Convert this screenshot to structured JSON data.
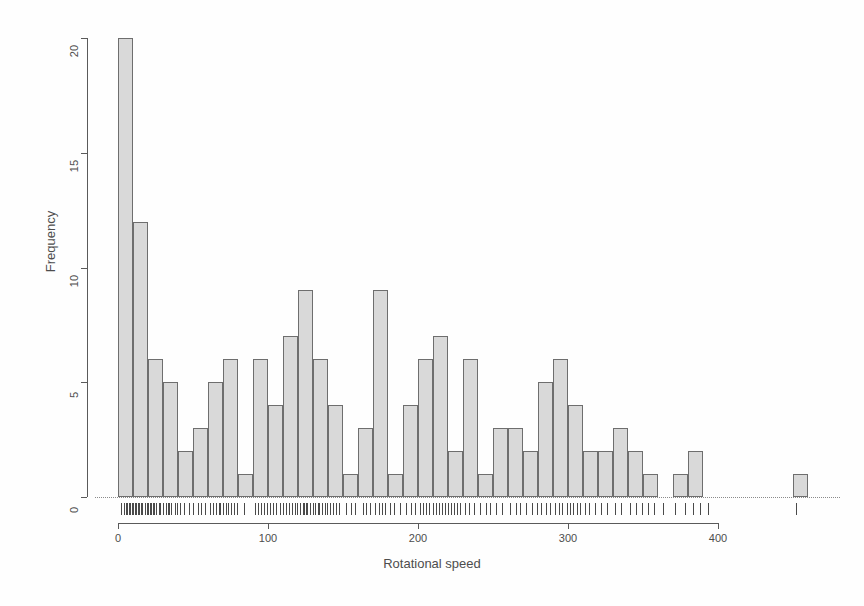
{
  "chart_data": {
    "type": "bar",
    "subtype": "histogram",
    "title": "",
    "xlabel": "Rotational speed",
    "ylabel": "Frequency",
    "xlim": [
      0,
      460
    ],
    "ylim": [
      0,
      20
    ],
    "bin_width": 10,
    "grid": false,
    "legend": null,
    "x_ticks": [
      0,
      100,
      200,
      300,
      400
    ],
    "x_tick_labels": [
      "0",
      "100",
      "200",
      "300",
      "400"
    ],
    "y_ticks": [
      0,
      5,
      10,
      15,
      20
    ],
    "y_tick_labels": [
      "0",
      "5",
      "10",
      "15",
      "20"
    ],
    "bin_starts": [
      0,
      10,
      20,
      30,
      40,
      50,
      60,
      70,
      80,
      90,
      100,
      110,
      120,
      130,
      140,
      150,
      160,
      170,
      180,
      190,
      200,
      210,
      220,
      230,
      240,
      250,
      260,
      270,
      280,
      290,
      300,
      310,
      320,
      330,
      340,
      350,
      360,
      370,
      380,
      390,
      400,
      410,
      420,
      430,
      440,
      450
    ],
    "values": [
      20,
      12,
      6,
      5,
      2,
      3,
      5,
      6,
      1,
      6,
      4,
      7,
      9,
      6,
      4,
      1,
      3,
      9,
      1,
      4,
      6,
      7,
      2,
      6,
      1,
      3,
      3,
      2,
      5,
      6,
      4,
      2,
      2,
      3,
      2,
      1,
      0,
      1,
      2,
      0,
      0,
      0,
      0,
      0,
      0,
      1
    ],
    "categories": [
      "0-10",
      "10-20",
      "20-30",
      "30-40",
      "40-50",
      "50-60",
      "60-70",
      "70-80",
      "80-90",
      "90-100",
      "100-110",
      "110-120",
      "120-130",
      "130-140",
      "140-150",
      "150-160",
      "160-170",
      "170-180",
      "180-190",
      "190-200",
      "200-210",
      "210-220",
      "220-230",
      "230-240",
      "240-250",
      "250-260",
      "260-270",
      "270-280",
      "280-290",
      "290-300",
      "300-310",
      "310-320",
      "320-330",
      "330-340",
      "340-350",
      "350-360",
      "360-370",
      "370-380",
      "380-390",
      "390-400",
      "400-410",
      "410-420",
      "420-430",
      "430-440",
      "440-450",
      "450-460"
    ],
    "rug_values": [
      2,
      4,
      5,
      6,
      7,
      8,
      9,
      10,
      11,
      12,
      13,
      14,
      15,
      16,
      18,
      19,
      20,
      21,
      22,
      23,
      24,
      25,
      27,
      28,
      30,
      32,
      33,
      34,
      35,
      38,
      39,
      41,
      44,
      47,
      50,
      53,
      55,
      58,
      61,
      63,
      65,
      67,
      68,
      70,
      72,
      73,
      75,
      77,
      79,
      84,
      91,
      93,
      95,
      97,
      99,
      101,
      103,
      105,
      108,
      110,
      112,
      114,
      116,
      118,
      119,
      121,
      123,
      124,
      125,
      126,
      128,
      130,
      131,
      133,
      134,
      136,
      138,
      139,
      141,
      143,
      145,
      147,
      152,
      155,
      158,
      163,
      165,
      168,
      171,
      174,
      176,
      178,
      181,
      184,
      188,
      192,
      195,
      198,
      201,
      203,
      205,
      207,
      210,
      212,
      214,
      216,
      218,
      220,
      222,
      224,
      226,
      228,
      231,
      234,
      237,
      241,
      245,
      248,
      252,
      256,
      261,
      265,
      268,
      272,
      276,
      279,
      282,
      285,
      288,
      291,
      294,
      296,
      299,
      301,
      303,
      306,
      308,
      311,
      314,
      318,
      322,
      326,
      331,
      335,
      341,
      345,
      349,
      353,
      357,
      363,
      371,
      378,
      383,
      388,
      393,
      452
    ],
    "colors": {
      "bar_fill": "#d9d9d9",
      "bar_border": "#6e6e6e",
      "axis": "#5a5a5a",
      "text": "#4d4d4d",
      "rug": "#4a4a4a",
      "background": "#ffffff"
    }
  },
  "axes": {
    "y_title": "Frequency",
    "x_title": "Rotational speed"
  }
}
